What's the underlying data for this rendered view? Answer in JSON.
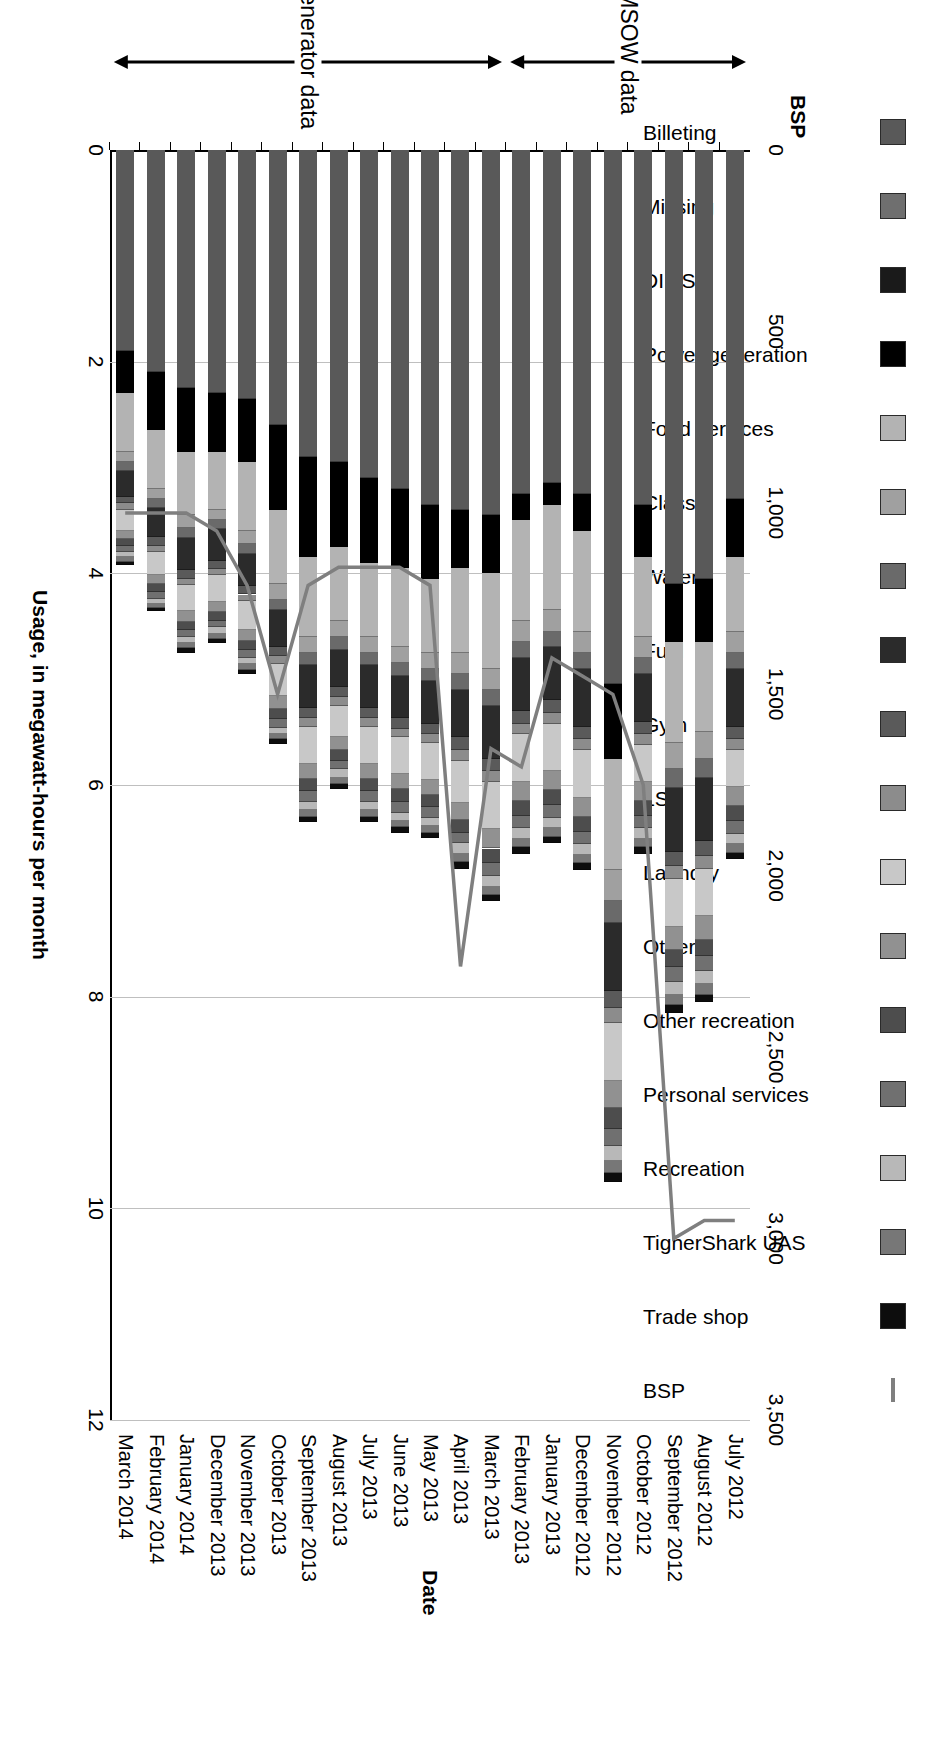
{
  "chart_data": {
    "type": "bar",
    "orientation": "vertical-stacked-with-secondary-line",
    "title": "",
    "xlabel": "Date",
    "ylabel": "Usage, in megawatt-hours per month",
    "y2label": "BSP",
    "ylim": [
      0,
      12
    ],
    "yticks": [
      "0",
      "2",
      "4",
      "6",
      "8",
      "10",
      "12"
    ],
    "y2lim": [
      0,
      3500
    ],
    "y2ticks": [
      "0",
      "500",
      "1,000",
      "1,500",
      "2,000",
      "2,500",
      "3,000",
      "3,500"
    ],
    "grid": true,
    "legend_position": "top",
    "categories": [
      "July 2012",
      "August 2012",
      "September 2012",
      "October 2012",
      "November 2012",
      "December 2012",
      "January 2013",
      "February 2013",
      "March 2013",
      "April 2013",
      "May 2013",
      "June 2013",
      "July 2013",
      "August 2013",
      "September 2013",
      "October 2013",
      "November 2013",
      "December 2013",
      "January 2014",
      "February 2014",
      "March 2014"
    ],
    "series": [
      {
        "name": "Billeting",
        "color": "#595959",
        "values": [
          3.3,
          4.05,
          4.1,
          3.35,
          5.05,
          3.25,
          3.15,
          3.25,
          3.45,
          3.4,
          3.35,
          3.2,
          3.1,
          2.95,
          2.9,
          2.6,
          2.35,
          2.3,
          2.25,
          2.1,
          1.9
        ]
      },
      {
        "name": "Missing",
        "color": "#6f6f6f",
        "values": [
          0.0,
          0.0,
          0.0,
          0.0,
          0.0,
          0.0,
          0.0,
          0.0,
          0.0,
          0.0,
          0.0,
          0.0,
          0.0,
          0.0,
          0.0,
          0.0,
          0.0,
          0.0,
          0.0,
          0.0,
          0.0
        ]
      },
      {
        "name": "DI LSA",
        "color": "#1a1a1a",
        "values": [
          0.0,
          0.0,
          0.0,
          0.0,
          0.0,
          0.0,
          0.0,
          0.0,
          0.0,
          0.0,
          0.0,
          0.0,
          0.0,
          0.0,
          0.0,
          0.0,
          0.0,
          0.0,
          0.0,
          0.0,
          0.0
        ]
      },
      {
        "name": "Power generation",
        "color": "#000000",
        "values": [
          0.55,
          0.6,
          0.55,
          0.5,
          0.7,
          0.35,
          0.2,
          0.25,
          0.55,
          0.55,
          0.7,
          0.75,
          0.8,
          0.8,
          0.95,
          0.8,
          0.6,
          0.55,
          0.6,
          0.55,
          0.4
        ]
      },
      {
        "name": "Food services",
        "color": "#b3b3b3",
        "values": [
          0.7,
          0.85,
          0.95,
          0.75,
          1.05,
          0.95,
          1.0,
          0.95,
          0.9,
          0.8,
          0.7,
          0.75,
          0.7,
          0.7,
          0.75,
          0.7,
          0.65,
          0.55,
          0.6,
          0.55,
          0.55
        ]
      },
      {
        "name": "Class I",
        "color": "#a0a0a0",
        "values": [
          0.2,
          0.25,
          0.25,
          0.2,
          0.3,
          0.2,
          0.2,
          0.2,
          0.2,
          0.2,
          0.15,
          0.15,
          0.15,
          0.15,
          0.15,
          0.15,
          0.12,
          0.1,
          0.12,
          0.1,
          0.1
        ]
      },
      {
        "name": "Water",
        "color": "#6a6a6a",
        "values": [
          0.15,
          0.18,
          0.18,
          0.15,
          0.2,
          0.15,
          0.15,
          0.15,
          0.15,
          0.15,
          0.12,
          0.12,
          0.12,
          0.12,
          0.12,
          0.1,
          0.1,
          0.08,
          0.1,
          0.08,
          0.08
        ]
      },
      {
        "name": "Fuel",
        "color": "#2b2b2b",
        "values": [
          0.55,
          0.6,
          0.6,
          0.45,
          0.65,
          0.55,
          0.5,
          0.5,
          0.5,
          0.45,
          0.4,
          0.4,
          0.4,
          0.35,
          0.4,
          0.35,
          0.3,
          0.3,
          0.3,
          0.28,
          0.25
        ]
      },
      {
        "name": "Gym",
        "color": "#5a5a5a",
        "values": [
          0.12,
          0.14,
          0.14,
          0.12,
          0.16,
          0.12,
          0.12,
          0.12,
          0.12,
          0.12,
          0.1,
          0.1,
          0.1,
          0.1,
          0.1,
          0.08,
          0.08,
          0.08,
          0.08,
          0.08,
          0.06
        ]
      },
      {
        "name": "LSS",
        "color": "#8c8c8c",
        "values": [
          0.1,
          0.12,
          0.12,
          0.1,
          0.14,
          0.1,
          0.1,
          0.1,
          0.1,
          0.1,
          0.08,
          0.08,
          0.08,
          0.08,
          0.08,
          0.08,
          0.06,
          0.06,
          0.06,
          0.06,
          0.06
        ]
      },
      {
        "name": "Laundry",
        "color": "#c8c8c8",
        "values": [
          0.35,
          0.45,
          0.45,
          0.35,
          0.55,
          0.45,
          0.45,
          0.45,
          0.45,
          0.4,
          0.35,
          0.35,
          0.35,
          0.3,
          0.35,
          0.3,
          0.28,
          0.25,
          0.25,
          0.22,
          0.2
        ]
      },
      {
        "name": "Other",
        "color": "#919191",
        "values": [
          0.18,
          0.22,
          0.22,
          0.18,
          0.25,
          0.18,
          0.18,
          0.18,
          0.18,
          0.16,
          0.14,
          0.14,
          0.14,
          0.12,
          0.14,
          0.12,
          0.1,
          0.1,
          0.1,
          0.08,
          0.08
        ]
      },
      {
        "name": "Other recreation",
        "color": "#4d4d4d",
        "values": [
          0.14,
          0.16,
          0.16,
          0.14,
          0.2,
          0.14,
          0.14,
          0.14,
          0.14,
          0.12,
          0.12,
          0.12,
          0.12,
          0.1,
          0.12,
          0.1,
          0.08,
          0.08,
          0.08,
          0.08,
          0.06
        ]
      },
      {
        "name": "Personal services",
        "color": "#707070",
        "values": [
          0.12,
          0.14,
          0.14,
          0.12,
          0.16,
          0.12,
          0.12,
          0.12,
          0.12,
          0.1,
          0.1,
          0.1,
          0.1,
          0.08,
          0.1,
          0.08,
          0.08,
          0.06,
          0.06,
          0.06,
          0.06
        ]
      },
      {
        "name": "Recreation",
        "color": "#b8b8b8",
        "values": [
          0.1,
          0.12,
          0.12,
          0.1,
          0.14,
          0.1,
          0.1,
          0.1,
          0.1,
          0.1,
          0.08,
          0.08,
          0.08,
          0.08,
          0.08,
          0.06,
          0.06,
          0.06,
          0.06,
          0.05,
          0.05
        ]
      },
      {
        "name": "TigherShark UAS",
        "color": "#777777",
        "values": [
          0.08,
          0.1,
          0.1,
          0.08,
          0.12,
          0.08,
          0.08,
          0.08,
          0.08,
          0.08,
          0.06,
          0.06,
          0.06,
          0.06,
          0.06,
          0.05,
          0.05,
          0.05,
          0.05,
          0.04,
          0.04
        ]
      },
      {
        "name": "Trade shop",
        "color": "#0d0d0d",
        "values": [
          0.06,
          0.07,
          0.07,
          0.06,
          0.08,
          0.06,
          0.06,
          0.06,
          0.06,
          0.06,
          0.05,
          0.05,
          0.05,
          0.05,
          0.05,
          0.04,
          0.04,
          0.04,
          0.04,
          0.03,
          0.03
        ]
      }
    ],
    "line_series": {
      "name": "BSP",
      "color": "#7f7f7f",
      "axis": "secondary",
      "values": [
        2950,
        2950,
        3000,
        1750,
        1500,
        1450,
        1400,
        1700,
        1650,
        2250,
        1200,
        1150,
        1150,
        1150,
        1200,
        1500,
        1200,
        1050,
        1000,
        1000,
        1000
      ]
    },
    "annotations": [
      {
        "label": "MSOW data",
        "from": "July 2012",
        "to": "February 2013"
      },
      {
        "label": "Generator data",
        "from": "March 2013",
        "to": "March 2014"
      }
    ]
  },
  "legend": {
    "items": [
      {
        "label": "Billeting",
        "color": "#595959",
        "icon": "legend-swatch-icon"
      },
      {
        "label": "Missing",
        "color": "#6f6f6f",
        "icon": "legend-swatch-icon"
      },
      {
        "label": "DI LSA",
        "color": "#1a1a1a",
        "icon": "legend-swatch-icon"
      },
      {
        "label": "Power generation",
        "color": "#000000",
        "icon": "legend-swatch-icon"
      },
      {
        "label": "Food services",
        "color": "#b3b3b3",
        "icon": "legend-swatch-icon"
      },
      {
        "label": "Class I",
        "color": "#a0a0a0",
        "icon": "legend-swatch-icon"
      },
      {
        "label": "Water",
        "color": "#6a6a6a",
        "icon": "legend-swatch-icon"
      },
      {
        "label": "Fuel",
        "color": "#2b2b2b",
        "icon": "legend-swatch-icon"
      },
      {
        "label": "Gym",
        "color": "#5a5a5a",
        "icon": "legend-swatch-icon"
      },
      {
        "label": "LSS",
        "color": "#8c8c8c",
        "icon": "legend-swatch-icon"
      },
      {
        "label": "Laundry",
        "color": "#c8c8c8",
        "icon": "legend-swatch-icon"
      },
      {
        "label": "Other",
        "color": "#919191",
        "icon": "legend-swatch-icon"
      },
      {
        "label": "Other recreation",
        "color": "#4d4d4d",
        "icon": "legend-swatch-icon"
      },
      {
        "label": "Personal services",
        "color": "#707070",
        "icon": "legend-swatch-icon"
      },
      {
        "label": "Recreation",
        "color": "#b8b8b8",
        "icon": "legend-swatch-icon"
      },
      {
        "label": "TigherShark UAS",
        "color": "#777777",
        "icon": "legend-swatch-icon"
      },
      {
        "label": "Trade shop",
        "color": "#0d0d0d",
        "icon": "legend-swatch-icon"
      },
      {
        "label": "BSP",
        "color": "#7f7f7f",
        "icon": "legend-line-icon"
      }
    ],
    "secondary_axis_title": "BSP"
  }
}
